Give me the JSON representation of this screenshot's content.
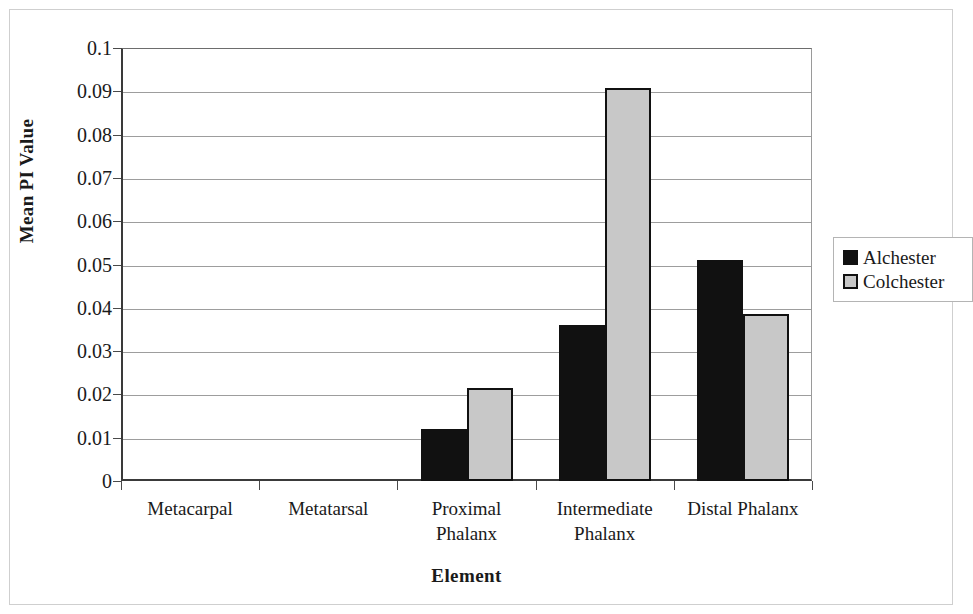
{
  "chart_data": {
    "type": "bar",
    "title": "",
    "xlabel": "Element",
    "ylabel": "Mean PI Value",
    "categories": [
      "Metacarpal",
      "Metatarsal",
      "Proximal Phalanx",
      "Intermediate Phalanx",
      "Distal Phalanx"
    ],
    "category_lines": [
      [
        "Metacarpal"
      ],
      [
        "Metatarsal"
      ],
      [
        "Proximal",
        "Phalanx"
      ],
      [
        "Intermediate",
        "Phalanx"
      ],
      [
        "Distal Phalanx"
      ]
    ],
    "series": [
      {
        "name": "Alchester",
        "color": "#111111",
        "values": [
          0,
          0,
          0.012,
          0.036,
          0.051
        ]
      },
      {
        "name": "Colchester",
        "color": "#c8c8c8",
        "values": [
          0,
          0,
          0.0215,
          0.0908,
          0.0385
        ]
      }
    ],
    "ylim": [
      0,
      0.1
    ],
    "ytick_step": 0.01,
    "ytick_labels": [
      "0.1",
      "0.09",
      "0.08",
      "0.07",
      "0.06",
      "0.05",
      "0.04",
      "0.03",
      "0.02",
      "0.01",
      "0"
    ],
    "ytick_values": [
      0.1,
      0.09,
      0.08,
      0.07,
      0.06,
      0.05,
      0.04,
      0.03,
      0.02,
      0.01,
      0
    ],
    "grid": true,
    "grid_axis": "y",
    "legend_position": "right",
    "bar_border_color": "#111111",
    "gridline_color": "#9d9d9d",
    "axis_color": "#3a3a3a"
  },
  "legend": {
    "entries": [
      {
        "label": "Alchester"
      },
      {
        "label": "Colchester"
      }
    ]
  },
  "axes": {
    "y_title": "Mean PI Value",
    "x_title": "Element"
  }
}
